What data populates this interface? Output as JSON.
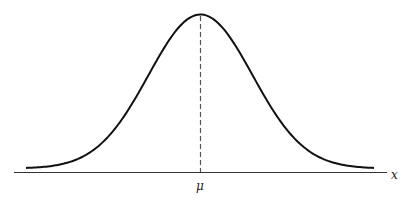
{
  "chart_data": {
    "type": "line",
    "title": "",
    "xlabel": "x",
    "ylabel": "",
    "x_tick_labels": [
      "μ"
    ],
    "grid": false,
    "legend": null,
    "series": [
      {
        "name": "normal density",
        "distribution": "normal",
        "mean": "μ",
        "description": "symmetric bell-shaped curve centered at μ"
      }
    ],
    "annotations": [
      {
        "type": "dashed-vertical-line",
        "at": "μ",
        "description": "from peak down to x-axis"
      }
    ],
    "colors": {
      "curve": "#111111",
      "axis": "#333333",
      "dashed": "#555555"
    }
  },
  "labels": {
    "mean": "μ",
    "axis": "x"
  }
}
